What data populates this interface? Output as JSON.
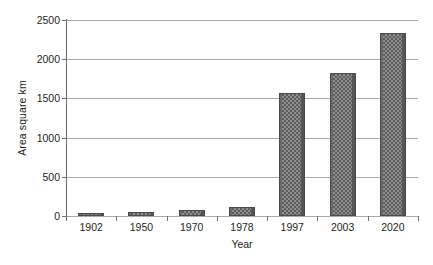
{
  "chart_data": {
    "type": "bar",
    "title": "",
    "xlabel": "Year",
    "ylabel": "Area square km",
    "categories": [
      "1902",
      "1950",
      "1970",
      "1978",
      "1997",
      "2003",
      "2020"
    ],
    "values": [
      30,
      50,
      75,
      115,
      1570,
      1830,
      2330
    ],
    "series": [
      {
        "name": "Area square km",
        "values": [
          30,
          50,
          75,
          115,
          1570,
          1830,
          2330
        ]
      }
    ],
    "ylim": [
      0,
      2500
    ],
    "yticks": [
      0,
      500,
      1000,
      1500,
      2000,
      2500
    ],
    "ytick_labels": [
      "0",
      "500",
      "1000",
      "1500",
      "2000",
      "2500"
    ],
    "grid": true,
    "grid_axis": "y",
    "legend": false,
    "legend_position": "none",
    "bar_fill": "checkered-gray",
    "colors": {
      "bar_fill": "#8e8e8e",
      "bar_pattern": "#5d5d5d",
      "bar_border": "#4a4a4a",
      "gridline": "#a9a9a9",
      "axis": "#6e6e6e",
      "text": "#231f20",
      "background": "#ffffff"
    }
  }
}
